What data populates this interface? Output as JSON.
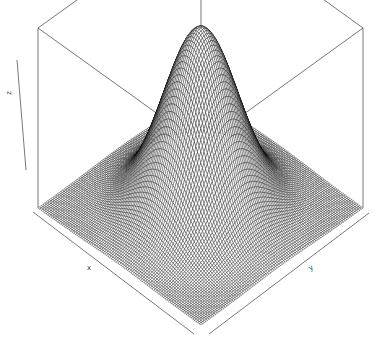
{
  "chart_data": {
    "type": "surface3d",
    "renderer": "perspective wireframe (R persp style)",
    "function": "bivariate normal density z = exp(-(x^2 + y^2)/2)",
    "title": "",
    "xlabel": "x",
    "ylabel": "y",
    "zlabel": "z",
    "xlim": [
      -3,
      3
    ],
    "ylim": [
      -3,
      3
    ],
    "zlim": [
      0,
      1
    ],
    "grid_resolution": 100,
    "view": {
      "theta": 45,
      "phi": 30
    },
    "box": true,
    "ticks": false,
    "peak": {
      "x": 0,
      "y": 0,
      "z": 1
    },
    "line_color": "#000000",
    "facet_color": "#ffffff",
    "background": "#ffffff"
  },
  "labels": {
    "x": "x",
    "y": "y",
    "z": "z"
  }
}
